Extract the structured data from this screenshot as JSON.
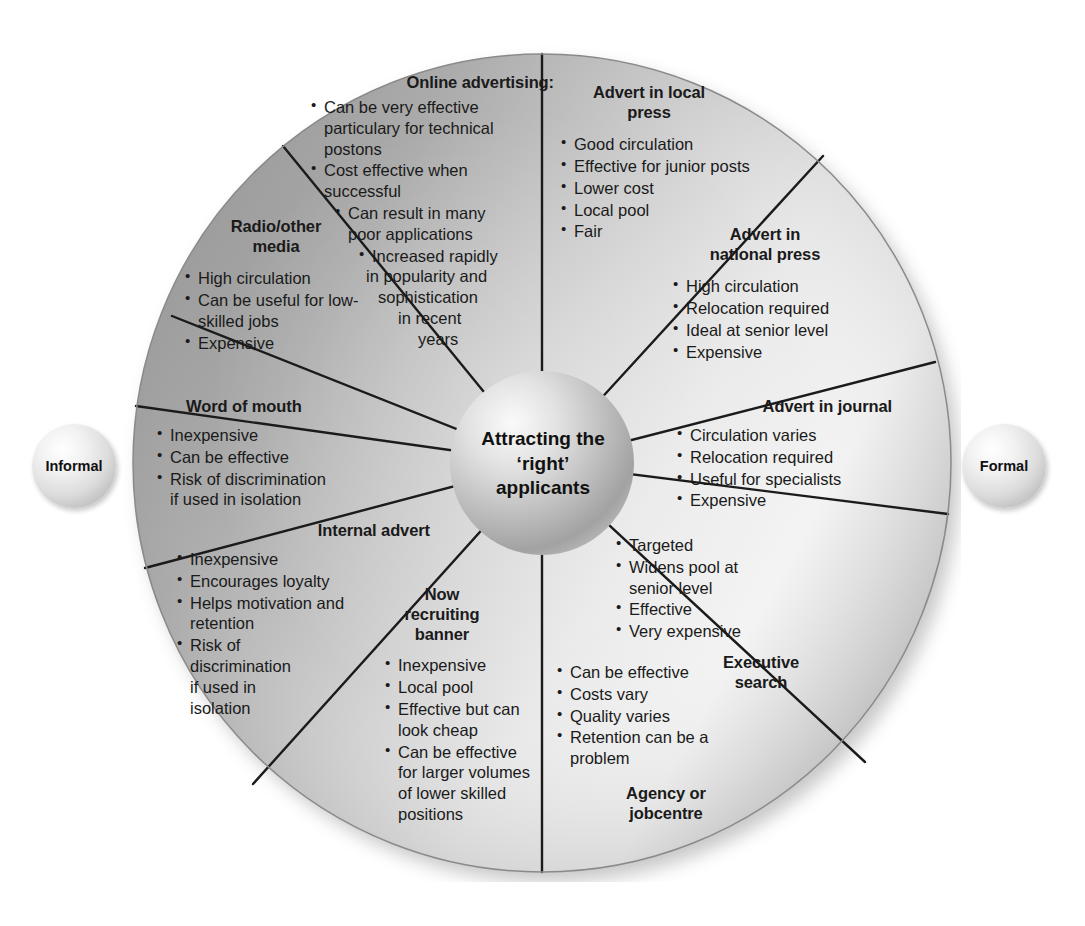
{
  "diagram": {
    "hub": {
      "line1": "Attracting the",
      "line2": "‘right’",
      "line3": "applicants"
    },
    "axis_labels": {
      "left": "Informal",
      "right": "Formal"
    },
    "colors": {
      "fill_dark": "#9a9a9a",
      "fill_light": "#f0f0f0",
      "outline": "#111111",
      "text": "#1a1a1a"
    },
    "segments": [
      {
        "id": "online-advertising",
        "title": "Online advertising:",
        "bullets": [
          "Can be very effective particulary for technical postons",
          "Cost effective when successful",
          "Can result in many poor applications",
          "Increased rapidly in popularity and sophistication in recent years"
        ]
      },
      {
        "id": "advert-in-local-press",
        "title": "Advert in local press",
        "bullets": [
          "Good circulation",
          "Effective for junior posts",
          "Lower cost",
          "Local pool",
          "Fair"
        ]
      },
      {
        "id": "advert-in-national-press",
        "title": "Advert in national press",
        "bullets": [
          "High circulation",
          "Relocation required",
          "Ideal at senior level",
          "Expensive"
        ]
      },
      {
        "id": "advert-in-journal",
        "title": "Advert in journal",
        "bullets": [
          "Circulation varies",
          "Relocation required",
          "Useful for specialists",
          "Expensive"
        ]
      },
      {
        "id": "executive-search",
        "title": "Executive search",
        "bullets": [
          "Targeted",
          "Widens pool at senior level",
          "Effective",
          "Very expensive"
        ]
      },
      {
        "id": "agency-or-jobcentre",
        "title": "Agency or jobcentre",
        "bullets": [
          "Can be effective",
          "Costs vary",
          "Quality varies",
          "Retention can be a problem"
        ]
      },
      {
        "id": "now-recruiting-banner",
        "title": "Now recruiting banner",
        "bullets": [
          "Inexpensive",
          "Local pool",
          "Effective but can look cheap",
          "Can be effective for larger volumes of lower skilled positions"
        ]
      },
      {
        "id": "internal-advert",
        "title": "Internal advert",
        "bullets": [
          "Inexpensive",
          "Encourages loyalty",
          "Helps motivation and retention",
          "Risk of discrimination if used in isolation"
        ]
      },
      {
        "id": "word-of-mouth",
        "title": "Word of mouth",
        "bullets": [
          "Inexpensive",
          "Can be effective",
          "Risk of discrimination if used in isolation"
        ]
      },
      {
        "id": "radio-other-media",
        "title": "Radio/other media",
        "bullets": [
          "High circulation",
          "Can be useful for low-skilled jobs",
          "Expensive"
        ]
      }
    ],
    "segment_text_lines": {
      "online-advertising": {
        "title_lines": [
          "Online advertising:"
        ],
        "bullet_lines": [
          [
            "Can be very effective",
            "particulary for technical",
            "postons"
          ],
          [
            "Cost effective when",
            "successful"
          ],
          [
            "Can result in many",
            "poor applications"
          ],
          [
            "Increased rapidly",
            "in popularity and",
            "sophistication",
            "in recent",
            "years"
          ]
        ]
      },
      "advert-in-local-press": {
        "title_lines": [
          "Advert in local",
          "press"
        ],
        "bullet_lines": [
          [
            "Good circulation"
          ],
          [
            "Effective for junior posts"
          ],
          [
            "Lower cost"
          ],
          [
            "Local pool"
          ],
          [
            "Fair"
          ]
        ]
      },
      "advert-in-national-press": {
        "title_lines": [
          "Advert in",
          "national press"
        ],
        "bullet_lines": [
          [
            "High circulation"
          ],
          [
            "Relocation required"
          ],
          [
            "Ideal at senior level"
          ],
          [
            "Expensive"
          ]
        ]
      },
      "advert-in-journal": {
        "title_lines": [
          "Advert in journal"
        ],
        "bullet_lines": [
          [
            "Circulation varies"
          ],
          [
            "Relocation required"
          ],
          [
            "Useful for specialists"
          ],
          [
            "Expensive"
          ]
        ]
      },
      "executive-search": {
        "title_lines": [
          "Executive",
          "search"
        ],
        "bullet_lines": [
          [
            "Targeted"
          ],
          [
            "Widens pool at",
            "senior level"
          ],
          [
            "Effective"
          ],
          [
            "Very expensive"
          ]
        ]
      },
      "agency-or-jobcentre": {
        "title_lines": [
          "Agency or",
          "jobcentre"
        ],
        "bullet_lines": [
          [
            "Can be effective"
          ],
          [
            "Costs vary"
          ],
          [
            "Quality varies"
          ],
          [
            "Retention can be a",
            "problem"
          ]
        ]
      },
      "now-recruiting-banner": {
        "title_lines": [
          "Now",
          "recruiting",
          "banner"
        ],
        "bullet_lines": [
          [
            "Inexpensive"
          ],
          [
            "Local pool"
          ],
          [
            "Effective but can",
            "look cheap"
          ],
          [
            "Can be effective",
            "for larger volumes",
            "of lower skilled",
            "positions"
          ]
        ]
      },
      "internal-advert": {
        "title_lines": [
          "Internal advert"
        ],
        "bullet_lines": [
          [
            "Inexpensive"
          ],
          [
            "Encourages loyalty"
          ],
          [
            "Helps motivation and",
            "retention"
          ],
          [
            "Risk of",
            "discrimination",
            "if used in",
            "isolation"
          ]
        ]
      },
      "word-of-mouth": {
        "title_lines": [
          "Word of mouth"
        ],
        "bullet_lines": [
          [
            "Inexpensive"
          ],
          [
            "Can be effective"
          ],
          [
            "Risk of discrimination",
            "if used in isolation"
          ]
        ]
      },
      "radio-other-media": {
        "title_lines": [
          "Radio/other",
          "media"
        ],
        "bullet_lines": [
          [
            "High circulation"
          ],
          [
            "Can be useful for low-",
            "skilled jobs"
          ],
          [
            "Expensive"
          ]
        ]
      }
    }
  }
}
